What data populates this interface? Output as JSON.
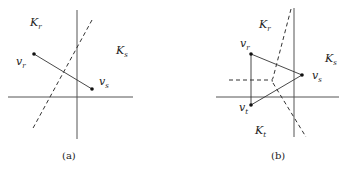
{
  "figure": {
    "panels": [
      {
        "caption": "(a)",
        "labels": {
          "K_r": {
            "main": "K",
            "sub": "r"
          },
          "K_s": {
            "main": "K",
            "sub": "s"
          },
          "v_r": {
            "main": "v",
            "sub": "r"
          },
          "v_s": {
            "main": "v",
            "sub": "s"
          }
        }
      },
      {
        "caption": "(b)",
        "labels": {
          "K_r": {
            "main": "K",
            "sub": "r"
          },
          "K_s": {
            "main": "K",
            "sub": "s"
          },
          "K_t": {
            "main": "K",
            "sub": "t"
          },
          "v_r": {
            "main": "v",
            "sub": "r"
          },
          "v_s": {
            "main": "v",
            "sub": "s"
          },
          "v_t": {
            "main": "v",
            "sub": "t"
          }
        }
      }
    ]
  }
}
